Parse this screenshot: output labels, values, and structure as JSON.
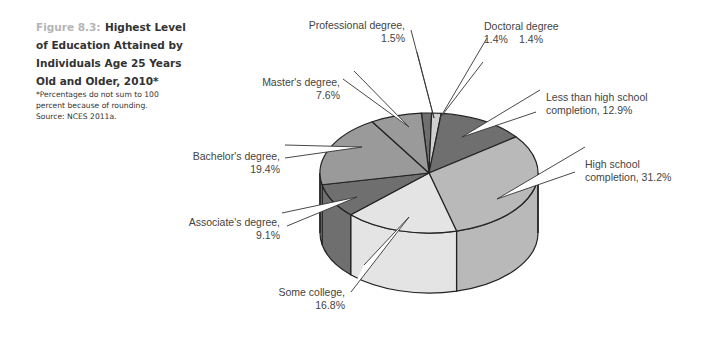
{
  "figure": {
    "number": "Figure 8.3:",
    "title": "Highest Level of Education Attained by Individuals Age 25 Years Old and Older, 2010*",
    "note": "*Percentages do not sum to 100 percent because of rounding.",
    "source": "Source: NCES 2011a."
  },
  "labels": {
    "professional": [
      "Professional degree,",
      "1.5%"
    ],
    "doctoral": [
      "Doctoral degree",
      "1.4%"
    ],
    "less_hs": [
      "Less than high school",
      "completion, 12.9%"
    ],
    "hs": [
      "High school",
      "completion, 31.2%"
    ],
    "some_college": [
      "Some college,",
      "16.8%"
    ],
    "associates": [
      "Associate's degree,",
      "9.1%"
    ],
    "bachelors": [
      "Bachelor's degree,",
      "19.4%"
    ],
    "masters": [
      "Master's degree,",
      "7.6%"
    ]
  },
  "colors": {
    "dark": "#6f6f6f",
    "medium": "#9a9a9a",
    "light": "#b9b9b9",
    "very_light": "#e4e4e4",
    "tiny_light": "#d0d0d0",
    "outline": "#222222"
  },
  "chart_data": {
    "type": "pie",
    "style": "3d",
    "title": "Highest Level of Education Attained by Individuals Age 25 Years Old and Older, 2010*",
    "categories": [
      "Professional degree",
      "Doctoral degree",
      "Less than high school completion",
      "High school completion",
      "Some college",
      "Associate's degree",
      "Bachelor's degree",
      "Master's degree"
    ],
    "values": [
      1.5,
      1.4,
      12.9,
      31.2,
      16.8,
      9.1,
      19.4,
      7.6
    ],
    "unit": "%",
    "annotations": [
      "*Percentages do not sum to 100 percent because of rounding.",
      "Source: NCES 2011a."
    ],
    "legend": "none (callout labels)"
  }
}
